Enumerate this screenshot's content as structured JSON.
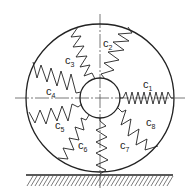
{
  "diagram": {
    "colors": {
      "stroke": "#222222",
      "background": "#ffffff",
      "centerline": "#555555"
    },
    "geometry": {
      "center": [
        100,
        98
      ],
      "outer_radius": 74,
      "inner_radius": 20,
      "ground_y": 175
    },
    "springs": [
      {
        "id": "c1",
        "label": "c",
        "sub": "1",
        "label_pos": [
          143,
          88
        ]
      },
      {
        "id": "c2",
        "label": "c",
        "sub": "2",
        "label_pos": [
          103,
          47
        ]
      },
      {
        "id": "c3",
        "label": "c",
        "sub": "3",
        "label_pos": [
          65,
          64
        ]
      },
      {
        "id": "c4",
        "label": "c",
        "sub": "4",
        "label_pos": [
          46,
          95
        ]
      },
      {
        "id": "c5",
        "label": "c",
        "sub": "5",
        "label_pos": [
          55,
          129
        ]
      },
      {
        "id": "c6",
        "label": "c",
        "sub": "6",
        "label_pos": [
          78,
          149
        ]
      },
      {
        "id": "c7",
        "label": "c",
        "sub": "7",
        "label_pos": [
          120,
          149
        ]
      },
      {
        "id": "c8",
        "label": "c",
        "sub": "8",
        "label_pos": [
          146,
          126
        ]
      }
    ],
    "ground_label": "ground (hatched)"
  }
}
